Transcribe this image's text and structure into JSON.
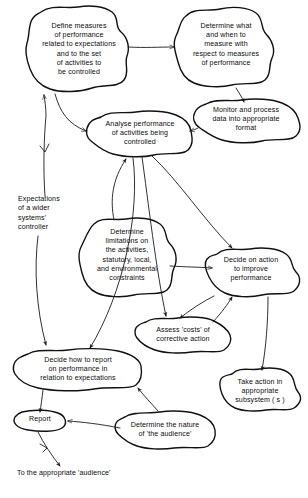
{
  "diagram": {
    "background_color": "#ffffff",
    "ink_color": "#111111",
    "style": "hand-drawn cloud shapes with curved arrows",
    "nodes": [
      {
        "id": "define-measures",
        "label": "Define measures\nof performance\nrelated to expectations\nand to the set\nof activities to\nbe controlled",
        "x": 24,
        "y": 8,
        "w": 110,
        "h": 88
      },
      {
        "id": "determine-what-when",
        "label": "Determine what\nand when to\nmeasure with\nrespect to measures\nof performance",
        "x": 170,
        "y": 8,
        "w": 110,
        "h": 78
      },
      {
        "id": "monitor-process",
        "label": "Monitor and process\ndata into appropriate\nformat",
        "x": 192,
        "y": 100,
        "w": 108,
        "h": 44
      },
      {
        "id": "analyse-performance",
        "label": "Analyse performance\nof activities being\ncontrolled",
        "x": 88,
        "y": 112,
        "w": 104,
        "h": 44
      },
      {
        "id": "determine-limitations",
        "label": "Determine\nlimitations on\nthe activities,\nstatutory, local,\nand environmental\nconstraints",
        "x": 80,
        "y": 218,
        "w": 96,
        "h": 82
      },
      {
        "id": "decide-action",
        "label": "Decide on action\nto improve\nperformance",
        "x": 204,
        "y": 248,
        "w": 94,
        "h": 50
      },
      {
        "id": "assess-costs",
        "label": "Assess 'costs' of\ncorrective action",
        "x": 134,
        "y": 318,
        "w": 98,
        "h": 34
      },
      {
        "id": "decide-how-to-report",
        "label": "Decide how to report\non performance in\nrelation to expectations",
        "x": 14,
        "y": 350,
        "w": 128,
        "h": 42
      },
      {
        "id": "take-action",
        "label": "Take action in\nappropriate\nsubsystem ( s )",
        "x": 220,
        "y": 368,
        "w": 80,
        "h": 46
      },
      {
        "id": "report",
        "label": "Report",
        "x": 10,
        "y": 410,
        "w": 56,
        "h": 22
      },
      {
        "id": "determine-audience",
        "label": "Determine the nature\nof 'the audience'",
        "x": 112,
        "y": 412,
        "w": 106,
        "h": 34
      }
    ],
    "annotations": [
      {
        "id": "expectations-wider-system",
        "label": "Expectations\nof a wider\nsystems'\ncontroller",
        "x": 16,
        "y": 194,
        "w": 78,
        "h": 40
      },
      {
        "id": "to-the-appropriate-audience",
        "label": "To the appropriate 'audience'",
        "x": 16,
        "y": 470,
        "w": 160,
        "h": 12
      }
    ],
    "edges": [
      {
        "id": "define-to-determine-what",
        "from": "define-measures",
        "to": "determine-what-when"
      },
      {
        "id": "determine-what-to-monitor",
        "from": "determine-what-when",
        "to": "monitor-process"
      },
      {
        "id": "monitor-to-analyse",
        "from": "monitor-process",
        "to": "analyse-performance"
      },
      {
        "id": "define-to-analyse",
        "from": "define-measures",
        "to": "analyse-performance"
      },
      {
        "id": "expectations-to-define",
        "from": "expectations-wider-system",
        "to": "define-measures"
      },
      {
        "id": "expectations-to-decide-how-to-report",
        "from": "expectations-wider-system",
        "to": "decide-how-to-report"
      },
      {
        "id": "determine-limitations-to-analyse",
        "from": "determine-limitations",
        "to": "analyse-performance"
      },
      {
        "id": "determine-limitations-to-decide-action",
        "from": "determine-limitations",
        "to": "decide-action"
      },
      {
        "id": "analyse-to-decide-action",
        "from": "analyse-performance",
        "to": "decide-action"
      },
      {
        "id": "analyse-to-assess-costs",
        "from": "analyse-performance",
        "to": "assess-costs"
      },
      {
        "id": "analyse-to-decide-how-to-report",
        "from": "analyse-performance",
        "to": "decide-how-to-report"
      },
      {
        "id": "assess-costs-to-decide-action",
        "from": "assess-costs",
        "to": "decide-action"
      },
      {
        "id": "decide-action-to-take-action",
        "from": "decide-action",
        "to": "take-action"
      },
      {
        "id": "decide-how-to-report-to-report",
        "from": "decide-how-to-report",
        "to": "report"
      },
      {
        "id": "determine-audience-to-report",
        "from": "determine-audience",
        "to": "report"
      },
      {
        "id": "determine-audience-to-decide-how-to-report",
        "from": "determine-audience",
        "to": "decide-how-to-report"
      },
      {
        "id": "report-to-audience",
        "from": "report",
        "to": "to-the-appropriate-audience"
      }
    ]
  }
}
